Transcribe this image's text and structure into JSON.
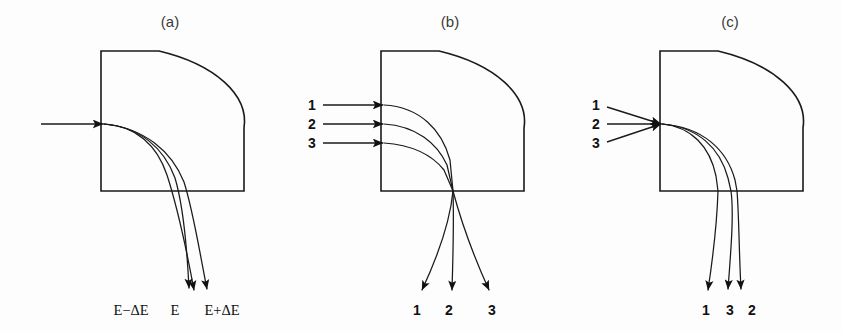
{
  "figure": {
    "background_color": "#fdfdfd",
    "ink_color": "#1a1a1a",
    "panel_count": 3
  },
  "panels": [
    {
      "id": "a",
      "caption": "(a)",
      "description": "Single incoming beam dispersed into three energy trajectories",
      "entry_labels": [],
      "exit_labels": [
        {
          "text": "E−ΔE",
          "order": 1
        },
        {
          "text": "E",
          "order": 2
        },
        {
          "text": "E+ΔE",
          "order": 3
        }
      ],
      "entry_mode": "single-beam",
      "exit_mode": "energy-dispersed"
    },
    {
      "id": "b",
      "caption": "(b)",
      "description": "Three parallel incoming rays focused to a point then diverging",
      "entry_labels": [
        {
          "text": "1",
          "order": 1
        },
        {
          "text": "2",
          "order": 2
        },
        {
          "text": "3",
          "order": 3
        }
      ],
      "exit_labels": [
        {
          "text": "1",
          "order": 1
        },
        {
          "text": "2",
          "order": 2
        },
        {
          "text": "3",
          "order": 3
        }
      ],
      "entry_mode": "parallel-rays",
      "exit_mode": "fanned-out"
    },
    {
      "id": "c",
      "caption": "(c)",
      "description": "Three converging incoming rays emerging with rays 3 and 2 crossed",
      "entry_labels": [
        {
          "text": "1",
          "order": 1
        },
        {
          "text": "2",
          "order": 2
        },
        {
          "text": "3",
          "order": 3
        }
      ],
      "exit_labels": [
        {
          "text": "1",
          "order": 1
        },
        {
          "text": "3",
          "order": 2
        },
        {
          "text": "2",
          "order": 3
        }
      ],
      "entry_mode": "converging-rays",
      "exit_mode": "crossed-order"
    }
  ]
}
